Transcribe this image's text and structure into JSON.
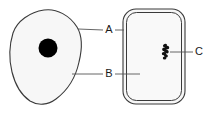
{
  "figure": {
    "type": "biology-diagram",
    "background_color": "#ffffff",
    "outline_color": "#3a3a3a",
    "fill_color": "#f7f7f7",
    "nucleus_color": "#000000",
    "leader_line_color": "#555555",
    "width": 209,
    "height": 114
  },
  "shapes": {
    "cell_blob": {
      "name": "irregular-cell-outline",
      "fill": "#f7f7f7",
      "stroke": "#3a3a3a"
    },
    "nucleus": {
      "name": "nucleus-dot",
      "cx": 48,
      "cy": 48,
      "r": 9.5,
      "fill": "#000000"
    },
    "rounded_box": {
      "name": "rounded-rectangle-outline",
      "x": 123,
      "y": 9,
      "width": 62,
      "height": 95,
      "radius": 13,
      "fill": "#f7f7f7",
      "stroke": "#3a3a3a",
      "inner_inset": 3
    },
    "organelle_cluster": {
      "name": "organelle-cluster",
      "fill": "#111111",
      "blobs": [
        {
          "cx": 165.0,
          "cy": 45.5,
          "rx": 2.1,
          "ry": 1.6,
          "rot": -20
        },
        {
          "cx": 167.0,
          "cy": 47.5,
          "rx": 2.3,
          "ry": 1.7,
          "rot": 15
        },
        {
          "cx": 164.3,
          "cy": 49.3,
          "rx": 2.2,
          "ry": 1.8,
          "rot": -10
        },
        {
          "cx": 166.4,
          "cy": 51.4,
          "rx": 2.4,
          "ry": 1.9,
          "rot": 25
        },
        {
          "cx": 164.0,
          "cy": 53.6,
          "rx": 2.2,
          "ry": 1.7,
          "rot": -5
        },
        {
          "cx": 165.9,
          "cy": 55.8,
          "rx": 2.0,
          "ry": 1.6,
          "rot": 20
        },
        {
          "cx": 164.6,
          "cy": 58.0,
          "rx": 1.8,
          "ry": 1.5,
          "rot": 0
        }
      ]
    }
  },
  "labels": [
    {
      "id": "A",
      "text": "A",
      "x": 109,
      "y": 30,
      "leader_left": {
        "x1": 78,
        "y1": 29,
        "x2": 103,
        "y2": 30
      },
      "leader_right": {
        "x1": 115,
        "y1": 30,
        "x2": 124,
        "y2": 30
      }
    },
    {
      "id": "B",
      "text": "B",
      "x": 109,
      "y": 74,
      "leader_left": {
        "x1": 72,
        "y1": 74,
        "x2": 103,
        "y2": 74
      },
      "leader_right": {
        "x1": 115,
        "y1": 74,
        "x2": 140,
        "y2": 74
      }
    },
    {
      "id": "C",
      "text": "C",
      "x": 199,
      "y": 52,
      "leader_left": {
        "x1": 170,
        "y1": 52,
        "x2": 193,
        "y2": 52
      },
      "leader_right": null
    }
  ]
}
